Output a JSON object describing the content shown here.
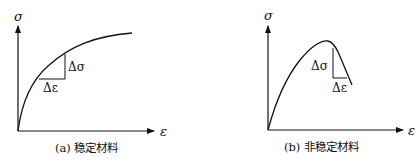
{
  "panels": [
    {
      "id": "a",
      "caption": "(a) 稳定材料",
      "y_axis_label": "σ",
      "x_axis_label": "ε",
      "delta_sigma_label": "Δσ",
      "delta_epsilon_label": "Δε",
      "curve_description": "monotonically increasing, concave stress-strain curve (positive tangent slope)"
    },
    {
      "id": "b",
      "caption": "(b) 非稳定材料",
      "y_axis_label": "σ",
      "x_axis_label": "ε",
      "delta_sigma_label": "Δσ",
      "delta_epsilon_label": "Δε",
      "curve_description": "stress-strain curve rising to a peak then softening (negative tangent slope after peak)"
    }
  ],
  "colors": {
    "line": "#111111",
    "background": "#ffffff"
  }
}
